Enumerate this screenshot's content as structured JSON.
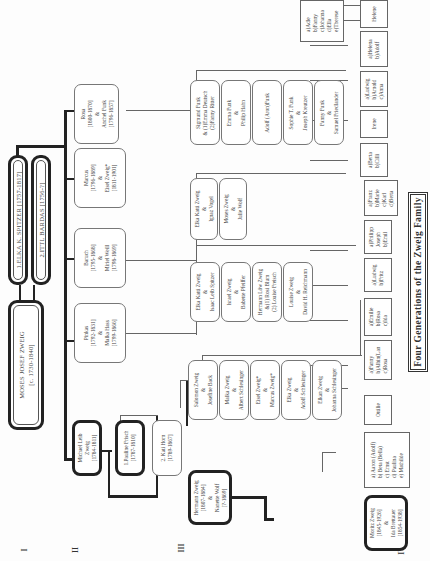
{
  "title": "Four Generations of the Zweig Family",
  "generations": [
    "I",
    "II",
    "III",
    "IV"
  ],
  "gen1": {
    "founder": {
      "lines": [
        "MOSES JOSEF ZWEIG",
        "[c. 1730-1840]"
      ]
    },
    "wife1": {
      "lines": [
        "1.ELKA K. SPITZER [1757-1817]"
      ]
    },
    "wife2": {
      "lines": [
        "2.ITTL BARDAS [1756-?]"
      ]
    }
  },
  "gen2": {
    "michael": {
      "lines": [
        "Michael Leib",
        "Zweig",
        "[1784-1811]"
      ]
    },
    "pauline": {
      "lines": [
        "1.Pauline Frisch",
        "[1787-1810]"
      ]
    },
    "kati": {
      "lines": [
        "2. Kati Horn",
        "[1789-1867]"
      ]
    },
    "pinkas": {
      "lines": [
        "Pinkas",
        "[1792-1831]",
        "&",
        "Malka Hass",
        "[1799-1866]"
      ]
    },
    "baruch": {
      "lines": [
        "Baruch",
        "[1795-1868]",
        "&",
        "Miriel Weill",
        "[1798-1869]"
      ]
    },
    "marcus": {
      "lines": [
        "Marcus",
        "[1796-1889]",
        "&",
        "Eisel Zweig*",
        "[1811-1901]"
      ]
    },
    "rosa": {
      "lines": [
        "Rosa",
        "[1800-1870]",
        "&",
        "Anchel Funk",
        "[1796-1857]"
      ]
    }
  },
  "gen3": {
    "hermann": {
      "lines": [
        "Hermann Zweig",
        "[1807-1884]",
        "&",
        "Nanette Wolf",
        "[?-1869]"
      ]
    },
    "michael_children": [
      {
        "lines": [
          "Salomon Zweig",
          "&",
          "Josefine Back"
        ]
      },
      {
        "lines": [
          "Malka Zweig",
          "&",
          "Albert Schlesinger"
        ]
      },
      {
        "lines": [
          "Eisel Zweig*",
          "&",
          "Marcus Zweig*"
        ]
      },
      {
        "lines": [
          "Elka Zweig",
          "&",
          "Adolf Schlesinger"
        ]
      },
      {
        "lines": [
          "Elkan Zweig",
          "&",
          "Johanna Schlesinger"
        ]
      }
    ],
    "pinkas_children": [
      {
        "lines": [
          "Elka Katti Zweig",
          "&",
          "Isaac Leib Spitzer"
        ]
      },
      {
        "lines": [
          "Israel Zweig",
          "&",
          "Babette Pfeiffer"
        ]
      },
      {
        "lines": [
          "Hermann Löw Zweig",
          "&(1) Rosi Blum",
          "(2) Louise Freisch"
        ]
      },
      {
        "lines": [
          "Louise Zweig",
          "&",
          "David H. Reichmann"
        ]
      }
    ],
    "baruch_children": [
      {
        "lines": [
          "Elka Katti Zweig",
          "&",
          "Ignaz Vogel"
        ]
      },
      {
        "lines": [
          "Moses Zweig",
          "&",
          "Julie Wolf"
        ]
      }
    ],
    "rosa_children": [
      {
        "lines": [
          "Sigmund Funk",
          "& (1)Emma Deutsch",
          "(2)Fanny Ritter"
        ]
      },
      {
        "lines": [
          "Emma Funk",
          "&",
          "Philip Hahn"
        ]
      },
      {
        "lines": [
          "Adolf (Aron)Funk"
        ]
      },
      {
        "lines": [
          "Sophie T. Funk",
          "&",
          "Joseph Kreutzer"
        ]
      },
      {
        "lines": [
          "Fanny Funk",
          "&",
          "Samuel Friedlander"
        ]
      }
    ]
  },
  "gen4": {
    "moritz": {
      "lines": [
        "Moritz Zweig",
        "[1845-1926]",
        "&",
        "Ida Brettauer",
        "[1854-1938]"
      ]
    },
    "moritz_children": {
      "lines": [
        "a) Aaron (Adolf)",
        "b) Beta (Bella)",
        "c) Ernst",
        "d) Paulina",
        "e) Mathilde"
      ]
    },
    "boxes": [
      {
        "lines": [
          "Ottilie"
        ]
      },
      {
        "lines": [
          "a)Fanny",
          "b)Albin(Lan",
          "c)Rosa"
        ]
      },
      {
        "lines": [
          "a)Emilie",
          "b)Rosa",
          "c)Ida"
        ]
      },
      {
        "lines": [
          "a)Ludwig",
          "b)Fritz"
        ]
      },
      {
        "lines": [
          "a)Philipp",
          "Joseph",
          "b)Emil"
        ]
      },
      {
        "lines": [
          "a)Franz",
          "b)Marie",
          "c)Karl",
          "d)Berta"
        ]
      },
      {
        "lines": [
          "a)Berta",
          "b)Cilli"
        ]
      },
      {
        "lines": [
          "Irene"
        ]
      },
      {
        "lines": [
          "a)Ludwig",
          "b)Arnold",
          "c)Anna"
        ]
      },
      {
        "lines": [
          "a)Helena",
          "b)Adolf"
        ]
      },
      {
        "lines": [
          "Helene"
        ]
      },
      {
        "lines": [
          "a)Adle",
          "b)Fanny",
          "c)Johanna",
          "d)Ella",
          "e)Therese"
        ]
      }
    ]
  }
}
